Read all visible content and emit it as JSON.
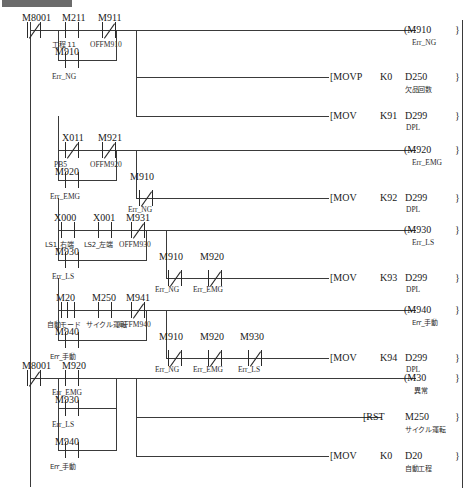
{
  "app": {
    "title_fragment": ""
  },
  "diagram": {
    "type": "ladder-logic",
    "language": "MELSEC ladder (GX Works)",
    "left_rail_label": "",
    "rungs": [
      {
        "id": "rung-1",
        "inputs": [
          {
            "device": "M8001",
            "comment": "",
            "type": "nc"
          },
          {
            "device": "M211",
            "comment": "工程 11",
            "type": "no"
          },
          {
            "device": "M911",
            "comment": "OFFM910",
            "type": "nc"
          },
          {
            "device": "M910",
            "comment": "Err_NG",
            "type": "no",
            "branch": "parallel-under-M211"
          }
        ],
        "outputs": [
          {
            "kind": "coil",
            "device": "M910",
            "comment": "Err_NG"
          },
          {
            "kind": "instruction",
            "mnemonic": "MOVP",
            "arg1": "K0",
            "arg2": "D250",
            "arg2_comment": "欠品回数"
          },
          {
            "kind": "instruction",
            "mnemonic": "MOV",
            "arg1": "K91",
            "arg2": "D299",
            "arg2_comment": "DPL"
          }
        ]
      },
      {
        "id": "rung-2",
        "inputs": [
          {
            "device": "X011",
            "comment": "PB5",
            "type": "nc"
          },
          {
            "device": "M921",
            "comment": "OFFM920",
            "type": "nc"
          },
          {
            "device": "M920",
            "comment": "Err_EMG",
            "type": "no",
            "branch": "parallel-under-X011"
          },
          {
            "device": "M910",
            "comment": "Err_NG",
            "type": "nc",
            "row": "second"
          }
        ],
        "outputs": [
          {
            "kind": "coil",
            "device": "M920",
            "comment": "Err_EMG"
          },
          {
            "kind": "instruction",
            "mnemonic": "MOV",
            "arg1": "K92",
            "arg2": "D299",
            "arg2_comment": "DPL"
          }
        ]
      },
      {
        "id": "rung-3",
        "inputs": [
          {
            "device": "X000",
            "comment": "LS1_右端",
            "type": "no"
          },
          {
            "device": "X001",
            "comment": "LS2_左端",
            "type": "no"
          },
          {
            "device": "M931",
            "comment": "OFFM930",
            "type": "nc"
          },
          {
            "device": "M930",
            "comment": "Err_LS",
            "type": "no",
            "branch": "parallel-under-X000"
          },
          {
            "device": "M910",
            "comment": "Err_NG",
            "type": "nc",
            "row": "second"
          },
          {
            "device": "M920",
            "comment": "Err_EMG",
            "type": "nc",
            "row": "second"
          }
        ],
        "outputs": [
          {
            "kind": "coil",
            "device": "M930",
            "comment": "Err_LS"
          },
          {
            "kind": "instruction",
            "mnemonic": "MOV",
            "arg1": "K93",
            "arg2": "D299",
            "arg2_comment": "DPL"
          }
        ]
      },
      {
        "id": "rung-4",
        "inputs": [
          {
            "device": "M20",
            "comment": "自動モード",
            "type": "edge"
          },
          {
            "device": "M250",
            "comment": "サイクル運転",
            "type": "no"
          },
          {
            "device": "M941",
            "comment": "OFFM940",
            "type": "nc"
          },
          {
            "device": "M940",
            "comment": "Err_手動",
            "type": "no",
            "branch": "parallel-under-M20"
          },
          {
            "device": "M910",
            "comment": "Err_NG",
            "type": "nc",
            "row": "second"
          },
          {
            "device": "M920",
            "comment": "Err_EMG",
            "type": "nc",
            "row": "second"
          },
          {
            "device": "M930",
            "comment": "Err_LS",
            "type": "nc",
            "row": "second"
          }
        ],
        "outputs": [
          {
            "kind": "coil",
            "device": "M940",
            "comment": "Err_手動"
          },
          {
            "kind": "instruction",
            "mnemonic": "MOV",
            "arg1": "K94",
            "arg2": "D299",
            "arg2_comment": "DPL"
          }
        ]
      },
      {
        "id": "rung-5",
        "inputs": [
          {
            "device": "M8001",
            "comment": "",
            "type": "nc"
          },
          {
            "device": "M920",
            "comment": "Err_EMG",
            "type": "no"
          },
          {
            "device": "M930",
            "comment": "Err_LS",
            "type": "no",
            "branch": "parallel"
          },
          {
            "device": "M940",
            "comment": "Err_手動",
            "type": "no",
            "branch": "parallel"
          }
        ],
        "outputs": [
          {
            "kind": "coil",
            "device": "M30",
            "comment": "異常"
          },
          {
            "kind": "instruction",
            "mnemonic": "RST",
            "arg1": "M250",
            "arg1_comment": "サイクル運転"
          },
          {
            "kind": "instruction",
            "mnemonic": "MOV",
            "arg1": "K0",
            "arg2": "D20",
            "arg2_comment": "自動工程"
          }
        ]
      }
    ],
    "symbols": {
      "coil_open": "(",
      "coil_close": ")",
      "instr_open": "[",
      "instr_close": "]",
      "return_bracket": "}"
    }
  }
}
